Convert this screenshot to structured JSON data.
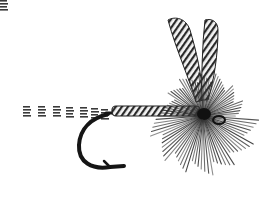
{
  "image": {
    "subject": "fishing fly illustration",
    "style": "black and white engraving",
    "background": "#ffffff",
    "ink": "#1a1a1a",
    "parts": [
      "tail",
      "body",
      "hook",
      "hackle",
      "wings"
    ]
  }
}
